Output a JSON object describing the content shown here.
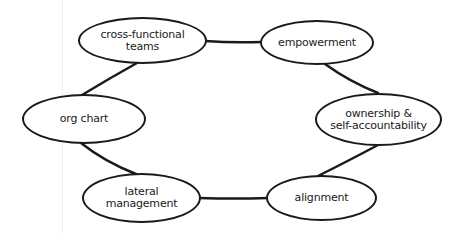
{
  "diagram": {
    "type": "cycle",
    "nodes": [
      {
        "id": "cross-functional-teams",
        "label": "cross-functional\nteams"
      },
      {
        "id": "empowerment",
        "label": "empowerment"
      },
      {
        "id": "ownership",
        "label": "ownership &\nself-accountability"
      },
      {
        "id": "alignment",
        "label": "alignment"
      },
      {
        "id": "lateral-management",
        "label": "lateral\nmanagement"
      },
      {
        "id": "org-chart",
        "label": "org chart"
      }
    ],
    "edges": [
      [
        "cross-functional-teams",
        "empowerment"
      ],
      [
        "empowerment",
        "ownership"
      ],
      [
        "ownership",
        "alignment"
      ],
      [
        "alignment",
        "lateral-management"
      ],
      [
        "lateral-management",
        "org-chart"
      ],
      [
        "org-chart",
        "cross-functional-teams"
      ]
    ],
    "colors": {
      "stroke": "#1a1a1a",
      "background": "#ffffff"
    }
  }
}
